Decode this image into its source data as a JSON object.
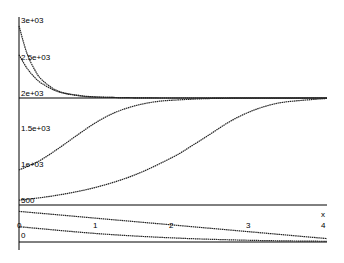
{
  "chart_data": {
    "type": "line",
    "title": "",
    "xlabel": "x",
    "ylabel": "",
    "xlim": [
      0,
      4
    ],
    "x_ticks": [
      "0",
      "1",
      "2",
      "3",
      "4"
    ],
    "upper_panel": {
      "ylim": [
        500,
        3000
      ],
      "y_ticks": [
        "3e+03",
        "2.5e+03",
        "2e+03",
        "1.5e+03",
        "1e+03",
        "500"
      ],
      "reference_line": 2000,
      "series": [
        {
          "name": "decay-high",
          "x": [
            0,
            0.1,
            0.2,
            0.3,
            0.5,
            0.75,
            1.0,
            1.5,
            2,
            3,
            4
          ],
          "values": [
            3000,
            2630,
            2400,
            2250,
            2100,
            2040,
            2015,
            2003,
            2000,
            2000,
            2000
          ]
        },
        {
          "name": "decay-low",
          "x": [
            0,
            0.1,
            0.2,
            0.3,
            0.5,
            0.75,
            1.0,
            1.5,
            2,
            3,
            4
          ],
          "values": [
            2600,
            2420,
            2290,
            2200,
            2090,
            2035,
            2013,
            2003,
            2000,
            2000,
            2000
          ]
        },
        {
          "name": "logistic-fast",
          "x": [
            0,
            0.25,
            0.5,
            0.75,
            1.0,
            1.25,
            1.5,
            1.75,
            2,
            2.5,
            3,
            4
          ],
          "values": [
            1000,
            1120,
            1290,
            1480,
            1660,
            1800,
            1890,
            1945,
            1970,
            1993,
            1998,
            2000
          ]
        },
        {
          "name": "logistic-slow",
          "x": [
            0,
            0.5,
            1.0,
            1.5,
            2.0,
            2.25,
            2.5,
            2.75,
            3.0,
            3.25,
            3.5,
            4.0
          ],
          "values": [
            580,
            650,
            760,
            930,
            1180,
            1340,
            1510,
            1680,
            1810,
            1900,
            1950,
            1995
          ]
        }
      ]
    },
    "lower_panel": {
      "y_ticks": [
        "0"
      ],
      "series": [
        {
          "name": "line-upper",
          "x": [
            0,
            1,
            2,
            3,
            4
          ],
          "values": [
            0.9,
            0.7,
            0.5,
            0.3,
            0.1
          ]
        },
        {
          "name": "line-lower",
          "x": [
            0,
            1,
            2,
            3,
            4
          ],
          "values": [
            0.45,
            0.25,
            0.12,
            0.05,
            0.02
          ]
        }
      ]
    },
    "grid": false,
    "legend": "none"
  },
  "labels": {
    "y_upper": [
      "3e+03",
      "2.5e+03",
      "2e+03",
      "1.5e+03",
      "1e+03",
      "500"
    ],
    "x_ticks": [
      "0",
      "1",
      "2",
      "3",
      "4"
    ],
    "x_axis_name": "x",
    "y_lower_zero": "0"
  }
}
